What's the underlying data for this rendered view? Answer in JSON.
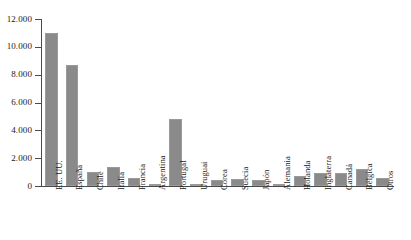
{
  "chart_data": {
    "type": "bar",
    "title": "",
    "xlabel": "",
    "ylabel": "",
    "ylim": [
      0,
      12000
    ],
    "yticks": [
      0,
      2000,
      4000,
      6000,
      8000,
      10000,
      12000
    ],
    "ytick_labels": [
      "0",
      "2.000",
      "4.000",
      "6.000",
      "8.000",
      "10.000",
      "12.000"
    ],
    "grid": false,
    "legend": false,
    "bar_color": "#8a8a8a",
    "axis_color": "#4a4a4a",
    "categories": [
      "EE. UU.",
      "España",
      "Chile",
      "Italia",
      "Francia",
      "Argentina",
      "Portugal",
      "Uruguai",
      "Corea",
      "Suecia",
      "Japón",
      "Alemania",
      "Holanda",
      "Inglaterra",
      "Canadá",
      "Bélgica",
      "Otros"
    ],
    "values": [
      11000,
      8700,
      1000,
      1350,
      550,
      180,
      4800,
      60,
      430,
      500,
      430,
      150,
      750,
      900,
      900,
      1200,
      600
    ]
  }
}
